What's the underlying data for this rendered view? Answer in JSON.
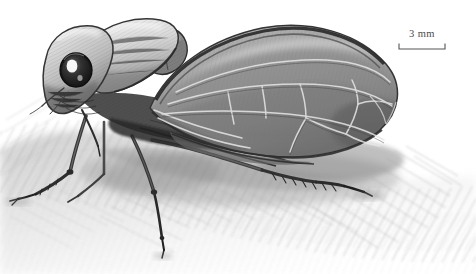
{
  "figure": {
    "name": "leafhopper-pencil-illustration",
    "view": "lateral",
    "orientation": "facing left",
    "medium": "graphite pencil drawing",
    "background_color": "#ffffff",
    "ink_color": "#2b2b2b",
    "tone_color": "#8d8d8d"
  },
  "scale_bar": {
    "label": "3 mm",
    "value": 3,
    "unit": "mm",
    "tick_style": "downward end ticks",
    "color": "#4a4a4a",
    "position": "upper-right"
  },
  "anatomy": {
    "head_label": "head",
    "eye_label": "compound eye",
    "pronotum_label": "pronotum",
    "scutellum_label": "scutellum",
    "forewing_label": "forewing",
    "wing_veins_label": "wing venation",
    "foreleg_label": "foreleg",
    "midleg_label": "midleg",
    "hindleg_label": "hind leg",
    "substrate_label": "shaded substrate"
  }
}
